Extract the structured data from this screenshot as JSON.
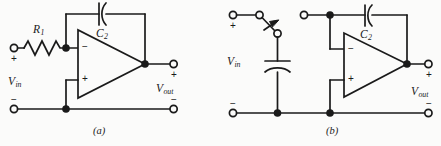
{
  "figure": {
    "background_color": "#fbfbfa",
    "wire_color": "#1a1a1a",
    "subfigures": [
      {
        "caption": "(a)",
        "description": "Inverting integrator with input resistor R1 and feedback capacitor C2",
        "components": [
          {
            "ref": "R1",
            "label_main": "R",
            "label_sub": "1",
            "type": "resistor-zigzag"
          },
          {
            "ref": "C2",
            "label_main": "C",
            "label_sub": "2",
            "type": "capacitor-curved-plate"
          },
          {
            "ref": "U1",
            "type": "op-amp-triangle",
            "inverting_pin": "−",
            "noninverting_pin": "+"
          }
        ],
        "ports": [
          {
            "name": "Vin",
            "label_main": "V",
            "label_sub": "in",
            "plus": "+",
            "minus": "−"
          },
          {
            "name": "Vout",
            "label_main": "V",
            "label_sub": "out",
            "plus": "+",
            "minus": "−"
          }
        ]
      },
      {
        "caption": "(b)",
        "description": "Switched-capacitor integrator: input switch and sampling capacitor replacing the resistor",
        "components": [
          {
            "ref": "SW1",
            "type": "spst-switch-with-arrow"
          },
          {
            "ref": "C1",
            "type": "capacitor-curved-plate-vertical"
          },
          {
            "ref": "C2",
            "label_main": "C",
            "label_sub": "2",
            "type": "capacitor-curved-plate"
          },
          {
            "ref": "U1",
            "type": "op-amp-triangle",
            "inverting_pin": "−",
            "noninverting_pin": "+"
          }
        ],
        "ports": [
          {
            "name": "Vin",
            "label_main": "V",
            "label_sub": "in",
            "plus": "+",
            "minus": "−"
          },
          {
            "name": "Vout",
            "label_main": "V",
            "label_sub": "out",
            "plus": "+",
            "minus": "−"
          }
        ]
      }
    ]
  },
  "labels": {
    "a": {
      "r1_main": "R",
      "r1_sub": "1",
      "c2_main": "C",
      "c2_sub": "2",
      "vin_main": "V",
      "vin_sub": "in",
      "vout_main": "V",
      "vout_sub": "out",
      "in_plus": "+",
      "in_minus": "−",
      "out_plus": "+",
      "out_minus": "−",
      "pin_inv": "−",
      "pin_noninv": "+",
      "caption": "(a)"
    },
    "b": {
      "c2_main": "C",
      "c2_sub": "2",
      "vin_main": "V",
      "vin_sub": "in",
      "vout_main": "V",
      "vout_sub": "out",
      "in_plus": "+",
      "in_minus": "−",
      "out_plus": "+",
      "out_minus": "−",
      "pin_inv": "−",
      "pin_noninv": "+",
      "caption": "(b)"
    }
  }
}
